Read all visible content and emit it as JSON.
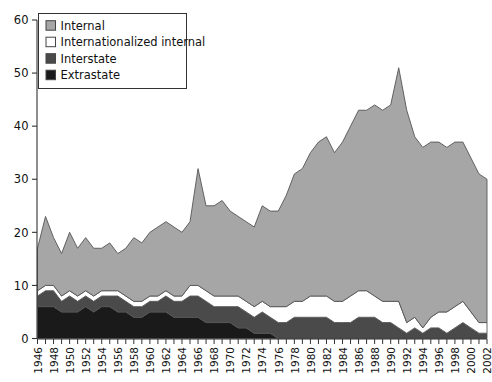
{
  "chart_data": {
    "type": "area",
    "stacked": true,
    "title": "",
    "subtitle": "",
    "xlabel": "",
    "ylabel": "",
    "xlim": [
      1946,
      2002
    ],
    "ylim": [
      0,
      60
    ],
    "yticks": [
      0,
      10,
      20,
      30,
      40,
      50,
      60
    ],
    "ytick_labels": [
      "0",
      "10",
      "20",
      "30",
      "40",
      "50",
      "60"
    ],
    "grid": false,
    "legend_position": "top-left",
    "x": [
      1946,
      1947,
      1948,
      1949,
      1950,
      1951,
      1952,
      1953,
      1954,
      1955,
      1956,
      1957,
      1958,
      1959,
      1960,
      1961,
      1962,
      1963,
      1964,
      1965,
      1966,
      1967,
      1968,
      1969,
      1970,
      1971,
      1972,
      1973,
      1974,
      1975,
      1976,
      1977,
      1978,
      1979,
      1980,
      1981,
      1982,
      1983,
      1984,
      1985,
      1986,
      1987,
      1988,
      1989,
      1990,
      1991,
      1992,
      1993,
      1994,
      1995,
      1996,
      1997,
      1998,
      1999,
      2000,
      2001,
      2002
    ],
    "xtick_labels": [
      "1946",
      "1948",
      "1950",
      "1952",
      "1954",
      "1956",
      "1958",
      "1960",
      "1962",
      "1964",
      "1966",
      "1968",
      "1970",
      "1972",
      "1974",
      "1976",
      "1978",
      "1980",
      "1982",
      "1984",
      "1986",
      "1988",
      "1990",
      "1992",
      "1994",
      "1996",
      "1998",
      "2000",
      "2002"
    ],
    "xtick_step": 2,
    "series": [
      {
        "name": "Extrastate",
        "color": "#1a1a1a",
        "values": [
          6,
          6,
          6,
          5,
          5,
          5,
          6,
          5,
          6,
          6,
          5,
          5,
          4,
          4,
          5,
          5,
          5,
          4,
          4,
          4,
          4,
          3,
          3,
          3,
          3,
          2,
          2,
          1,
          1,
          1,
          0,
          0,
          0,
          0,
          0,
          0,
          0,
          0,
          0,
          0,
          0,
          0,
          0,
          0,
          0,
          0,
          0,
          0,
          0,
          0,
          0,
          0,
          0,
          0,
          0,
          0,
          0
        ]
      },
      {
        "name": "Interstate",
        "color": "#4a4a4a",
        "values": [
          2,
          3,
          3,
          2,
          3,
          2,
          2,
          2,
          2,
          2,
          3,
          2,
          2,
          2,
          2,
          2,
          3,
          3,
          3,
          4,
          4,
          4,
          3,
          3,
          3,
          4,
          3,
          3,
          4,
          3,
          3,
          3,
          4,
          4,
          4,
          4,
          4,
          3,
          3,
          3,
          4,
          4,
          4,
          3,
          3,
          2,
          1,
          2,
          1,
          2,
          2,
          1,
          2,
          3,
          2,
          1,
          1
        ]
      },
      {
        "name": "Internationalized internal",
        "color": "#ffffff",
        "values": [
          1,
          1,
          1,
          1,
          1,
          1,
          1,
          1,
          1,
          1,
          1,
          1,
          1,
          1,
          1,
          1,
          1,
          1,
          1,
          2,
          2,
          2,
          2,
          2,
          2,
          2,
          2,
          2,
          2,
          2,
          3,
          3,
          3,
          3,
          4,
          4,
          4,
          4,
          4,
          5,
          5,
          5,
          4,
          4,
          4,
          5,
          2,
          2,
          1,
          2,
          3,
          4,
          4,
          4,
          3,
          2,
          2
        ]
      },
      {
        "name": "Internal",
        "color": "#a6a6a6",
        "values": [
          8,
          13,
          9,
          8,
          11,
          9,
          10,
          9,
          8,
          9,
          7,
          9,
          12,
          11,
          12,
          13,
          13,
          13,
          12,
          12,
          22,
          16,
          17,
          18,
          16,
          15,
          15,
          15,
          18,
          18,
          18,
          21,
          24,
          25,
          27,
          29,
          30,
          28,
          30,
          32,
          34,
          34,
          36,
          36,
          37,
          44,
          40,
          34,
          34,
          33,
          32,
          31,
          31,
          30,
          29,
          28,
          27
        ]
      }
    ],
    "totals": [
      17,
      23,
      19,
      16,
      20,
      17,
      19,
      17,
      17,
      18,
      16,
      17,
      19,
      18,
      20,
      21,
      22,
      21,
      20,
      22,
      32,
      25,
      25,
      26,
      24,
      23,
      22,
      21,
      25,
      24,
      24,
      27,
      31,
      32,
      35,
      37,
      38,
      35,
      37,
      40,
      43,
      43,
      44,
      43,
      44,
      51,
      43,
      38,
      36,
      37,
      37,
      36,
      37,
      37,
      34,
      31,
      30
    ]
  },
  "legend": {
    "items": [
      {
        "label": "Internal",
        "swatch": "internal-swatch"
      },
      {
        "label": "Internationalized  internal",
        "swatch": "internationalized-internal-swatch"
      },
      {
        "label": "Interstate",
        "swatch": "interstate-swatch"
      },
      {
        "label": "Extrastate",
        "swatch": "extrastate-swatch"
      }
    ]
  },
  "colors": {
    "internal": "#a6a6a6",
    "internationalized_internal": "#ffffff",
    "interstate": "#4a4a4a",
    "extrastate": "#1a1a1a",
    "outline": "#555555",
    "axis": "#333333",
    "text": "#111111"
  }
}
